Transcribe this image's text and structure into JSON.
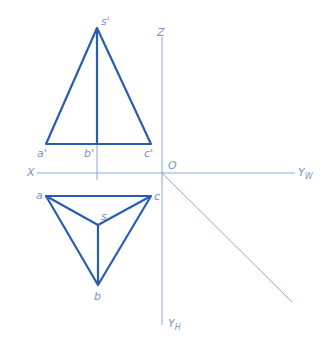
{
  "diagram": {
    "type": "orthographic-projection",
    "colors": {
      "object": "#2a5db0",
      "axis": "#8fa6d6",
      "label": "#7a93c8"
    },
    "axes": {
      "x_label": "X",
      "z_label": "Z",
      "origin_label": "O",
      "yw_label": "Y",
      "yw_sub": "W",
      "yh_label": "Y",
      "yh_sub": "H"
    },
    "front_view": {
      "apex": {
        "label": "s'",
        "x": 97,
        "y": 28
      },
      "a": {
        "label": "a'",
        "x": 46,
        "y": 144
      },
      "b": {
        "label": "b'",
        "x": 97,
        "y": 144
      },
      "c": {
        "label": "c'",
        "x": 151,
        "y": 144
      }
    },
    "top_view": {
      "a": {
        "label": "a",
        "x": 46,
        "y": 196
      },
      "c": {
        "label": "c",
        "x": 151,
        "y": 196
      },
      "s": {
        "label": "s",
        "x": 98,
        "y": 225
      },
      "b": {
        "label": "b",
        "x": 98,
        "y": 285
      }
    }
  }
}
